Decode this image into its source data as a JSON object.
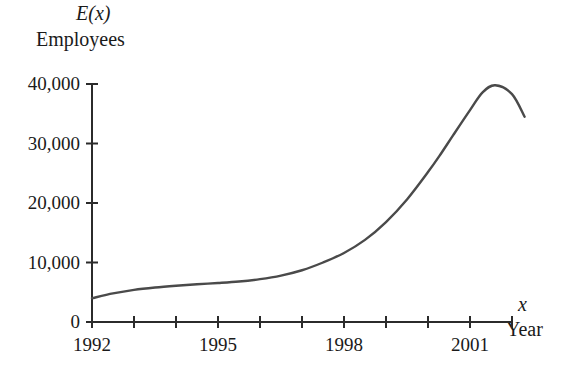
{
  "chart_data": {
    "type": "line",
    "title": "",
    "subtitle": "",
    "ylabel_function": "E(x)",
    "ylabel_unit": "Employees",
    "xlabel_function": "x",
    "xlabel_unit": "Year",
    "xlim": [
      1992,
      2002.5
    ],
    "ylim": [
      0,
      42000
    ],
    "grid": false,
    "legend": null,
    "y_ticks": [
      {
        "value": 0,
        "label": "0"
      },
      {
        "value": 10000,
        "label": "10,000"
      },
      {
        "value": 20000,
        "label": "20,000"
      },
      {
        "value": 30000,
        "label": "30,000"
      },
      {
        "value": 40000,
        "label": "40,000"
      }
    ],
    "x_ticks": [
      {
        "value": 1992,
        "label": "1992"
      },
      {
        "value": 1993,
        "label": ""
      },
      {
        "value": 1994,
        "label": ""
      },
      {
        "value": 1995,
        "label": "1995"
      },
      {
        "value": 1996,
        "label": ""
      },
      {
        "value": 1997,
        "label": ""
      },
      {
        "value": 1998,
        "label": "1998"
      },
      {
        "value": 1999,
        "label": ""
      },
      {
        "value": 2000,
        "label": ""
      },
      {
        "value": 2001,
        "label": "2001"
      },
      {
        "value": 2002,
        "label": ""
      }
    ],
    "series": [
      {
        "name": "E(x)",
        "color": "#4a4a4a",
        "x": [
          1992,
          1992.5,
          1993,
          1993.5,
          1994,
          1994.5,
          1995,
          1995.5,
          1996,
          1996.5,
          1997,
          1997.5,
          1998,
          1998.5,
          1999,
          1999.5,
          2000,
          2000.3,
          2000.6,
          2001,
          2001.3,
          2001.6,
          2002,
          2002.3
        ],
        "values": [
          4000,
          4800,
          5400,
          5800,
          6100,
          6350,
          6550,
          6800,
          7200,
          7800,
          8700,
          10000,
          11600,
          13800,
          16800,
          20600,
          25200,
          28200,
          31400,
          35600,
          38600,
          39800,
          38300,
          34500
        ]
      }
    ],
    "annotations": []
  }
}
